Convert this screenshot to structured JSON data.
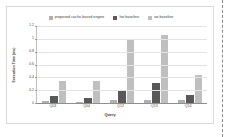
{
  "figure": {
    "background_color": "#ffffff",
    "frame_color": "#d9d9d9"
  },
  "chart_data": {
    "type": "bar",
    "title": "",
    "subtitle": "",
    "xlabel": "Query",
    "ylabel": "Execution Time (ms)",
    "categories": [
      "Q03",
      "Q04",
      "Q12",
      "Q13",
      "Q14"
    ],
    "series": [
      {
        "name": "proposed cache-based engine",
        "color": "#b0b0b0",
        "values": [
          0.03,
          0.02,
          0.04,
          0.04,
          0.05
        ]
      },
      {
        "name": "hw baseline",
        "color": "#595959",
        "values": [
          0.11,
          0.08,
          0.21,
          0.31,
          0.12
        ]
      },
      {
        "name": "sw baseline",
        "color": "#bfbfbf",
        "values": [
          0.35,
          0.35,
          0.99,
          1.06,
          0.43
        ]
      }
    ],
    "ylim": [
      0,
      1.2
    ],
    "yticks": [
      "0",
      "0.2",
      "0.4",
      "0.6",
      "0.8",
      "1",
      "1.2"
    ],
    "ytick_values": [
      0,
      0.2,
      0.4,
      0.6,
      0.8,
      1,
      1.2
    ],
    "grid": true,
    "legend_position": "top"
  },
  "page_guides": {
    "right_margin_style": "dashed"
  }
}
